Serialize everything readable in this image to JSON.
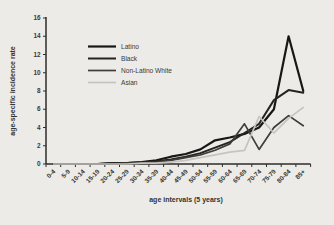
{
  "figure": {
    "background": "#edebe7",
    "axis_color": "#2e2c29",
    "text_color": "#3a3833"
  },
  "chart_data": {
    "type": "line",
    "title": "",
    "xlabel": "age intervals (5 years)",
    "ylabel": "age-specific incidence rate",
    "ylim": [
      0,
      16
    ],
    "ytick_step": 2,
    "ytick_labels": [
      "0",
      "2",
      "4",
      "6",
      "8",
      "10",
      "12",
      "14",
      "16"
    ],
    "grid": false,
    "legend_position": "upper-left-inside",
    "categories": [
      "0-4",
      "5-9",
      "10-14",
      "15-19",
      "20-24",
      "25-29",
      "30-34",
      "35-39",
      "40-44",
      "45-49",
      "50-54",
      "55-59",
      "60-64",
      "65-69",
      "70-74",
      "75-79",
      "80-84",
      "85+"
    ],
    "series": [
      {
        "name": "Latino",
        "color": "#171717",
        "stroke_width": 2.2,
        "values": [
          0,
          0,
          0,
          0,
          0.1,
          0.1,
          0.2,
          0.4,
          0.8,
          1.1,
          1.6,
          2.6,
          2.9,
          3.3,
          4.0,
          6.0,
          14.0,
          8.0
        ]
      },
      {
        "name": "Black",
        "color": "#242422",
        "stroke_width": 2.0,
        "values": [
          0,
          0,
          0,
          0,
          0.1,
          0.1,
          0.2,
          0.3,
          0.5,
          0.8,
          1.2,
          1.8,
          2.4,
          3.4,
          4.4,
          7.0,
          8.1,
          7.8
        ]
      },
      {
        "name": "Non-Latino White",
        "color": "#403e3a",
        "stroke_width": 1.7,
        "values": [
          0,
          0,
          0,
          0,
          0,
          0.1,
          0.1,
          0.2,
          0.4,
          0.7,
          1.0,
          1.5,
          2.2,
          4.4,
          1.6,
          4.0,
          5.3,
          4.2
        ]
      },
      {
        "name": "Asian",
        "color": "#c7c4be",
        "stroke_width": 1.7,
        "values": [
          0,
          0,
          0,
          0,
          0,
          0,
          0.1,
          0.1,
          0.2,
          0.4,
          0.7,
          1.0,
          1.3,
          1.5,
          5.2,
          3.4,
          5.0,
          6.2
        ]
      }
    ]
  }
}
